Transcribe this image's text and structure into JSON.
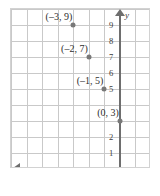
{
  "chart_data": {
    "type": "scatter",
    "title": "",
    "xlabel": "x",
    "ylabel": "y",
    "xlim": [
      -7,
      2
    ],
    "ylim": [
      0,
      10
    ],
    "grid": true,
    "legend": null,
    "x_ticks": [
      {
        "value": -6,
        "label": "–6"
      },
      {
        "value": -5,
        "label": "–5"
      },
      {
        "value": -4,
        "label": "–4"
      },
      {
        "value": -3,
        "label": "–3"
      },
      {
        "value": -2,
        "label": "–2"
      },
      {
        "value": -1,
        "label": "–1"
      },
      {
        "value": 1,
        "label": "1"
      }
    ],
    "y_ticks": [
      {
        "value": 9,
        "label": "9"
      },
      {
        "value": 8,
        "label": "8"
      },
      {
        "value": 7,
        "label": "7"
      },
      {
        "value": 6,
        "label": "6"
      },
      {
        "value": 5,
        "label": "5"
      },
      {
        "value": 2,
        "label": "2"
      },
      {
        "value": 1,
        "label": "1"
      }
    ],
    "points": [
      {
        "x": -3,
        "y": 9,
        "label": "(–3, 9)"
      },
      {
        "x": -2,
        "y": 7,
        "label": "(–2, 7)"
      },
      {
        "x": -1,
        "y": 5,
        "label": "(–1, 5)"
      },
      {
        "x": 0,
        "y": 3,
        "label": "(0, 3)"
      }
    ],
    "point_color": "#787878",
    "grid_color": "#c9c9c9",
    "axis_color": "#6e6e6e",
    "text_color": "#2e2e2e"
  }
}
